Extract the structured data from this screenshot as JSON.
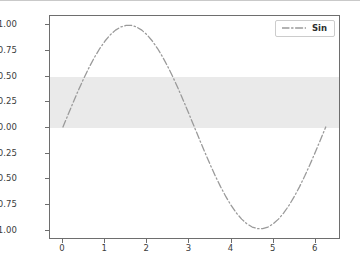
{
  "chart_data": {
    "type": "line",
    "title": "",
    "xlabel": "",
    "ylabel": "",
    "xlim": [
      -0.31,
      6.6
    ],
    "ylim": [
      -1.09,
      1.09
    ],
    "grid": false,
    "legend_position": "upper right",
    "xticks": [
      "0",
      "1",
      "2",
      "3",
      "4",
      "5",
      "6"
    ],
    "xtick_values": [
      0,
      1,
      2,
      3,
      4,
      5,
      6
    ],
    "yticks": [
      "1.00",
      "0.75",
      "0.50",
      "0.25",
      "0.00",
      "−0.25",
      "−0.50",
      "−0.75",
      "−1.00"
    ],
    "ytick_values": [
      1.0,
      0.75,
      0.5,
      0.25,
      0.0,
      -0.25,
      -0.5,
      -0.75,
      -1.0
    ],
    "series": [
      {
        "name": "Sin",
        "linestyle": "dashdot",
        "color": "#9a9a9a",
        "linewidth": 1.3,
        "x": [
          0.0,
          0.1257,
          0.2513,
          0.377,
          0.5027,
          0.6283,
          0.754,
          0.8796,
          1.0053,
          1.131,
          1.2566,
          1.3823,
          1.508,
          1.6336,
          1.7593,
          1.885,
          2.0106,
          2.1363,
          2.262,
          2.3876,
          2.5133,
          2.6389,
          2.7646,
          2.8903,
          3.0159,
          3.1416,
          3.2673,
          3.3929,
          3.5186,
          3.6442,
          3.7699,
          3.8956,
          4.0212,
          4.1469,
          4.2726,
          4.3982,
          4.5239,
          4.6495,
          4.7752,
          4.9009,
          5.0265,
          5.1522,
          5.2779,
          5.4035,
          5.5292,
          5.6549,
          5.7805,
          5.9062,
          6.0319,
          6.1575,
          6.2832
        ],
        "y": [
          0.0,
          0.1253,
          0.2487,
          0.3681,
          0.4818,
          0.5878,
          0.6845,
          0.7705,
          0.8443,
          0.9048,
          0.9511,
          0.9823,
          0.998,
          0.998,
          0.9823,
          0.9511,
          0.9048,
          0.8443,
          0.7705,
          0.6845,
          0.5878,
          0.4818,
          0.3681,
          0.2487,
          0.1253,
          0.0,
          -0.1253,
          -0.2487,
          -0.3681,
          -0.4818,
          -0.5878,
          -0.6845,
          -0.7705,
          -0.8443,
          -0.9048,
          -0.9511,
          -0.9823,
          -0.998,
          -0.998,
          -0.9823,
          -0.9511,
          -0.9048,
          -0.8443,
          -0.7705,
          -0.6845,
          -0.5878,
          -0.4818,
          -0.3681,
          -0.2487,
          -0.1253,
          0.0
        ]
      }
    ],
    "annotations": [
      {
        "kind": "axhspan",
        "name": "shaded-band",
        "ymin": 0.0,
        "ymax": 0.5,
        "color": "#eaeaea",
        "hatch": "vertical-lines"
      }
    ],
    "legend": [
      {
        "label": "Sin",
        "color": "#9a9a9a",
        "linestyle": "dashdot"
      }
    ]
  },
  "style": {
    "figure_background": "#ffffff",
    "axes_background": "#ffffff",
    "spine_color": "#6e6e6e",
    "tick_label_color": "#3b3b3b",
    "line_color": "#9a9a9a",
    "band_color": "#eaeaea"
  }
}
